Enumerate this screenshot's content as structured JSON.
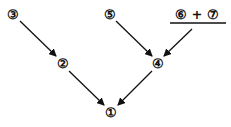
{
  "diagram": {
    "nodes": [
      {
        "id": "n3",
        "label": "③",
        "x": 13,
        "y": 14
      },
      {
        "id": "n2",
        "label": "②",
        "x": 63,
        "y": 63
      },
      {
        "id": "n5",
        "label": "⑤",
        "x": 110,
        "y": 14
      },
      {
        "id": "n67",
        "label": "⑥ + ⑦",
        "x": 197,
        "y": 14
      },
      {
        "id": "n4",
        "label": "④",
        "x": 158,
        "y": 63
      },
      {
        "id": "n1",
        "label": "①",
        "x": 111,
        "y": 112
      }
    ],
    "edges": [
      {
        "from": "③",
        "to": "②"
      },
      {
        "from": "②",
        "to": "①"
      },
      {
        "from": "⑤",
        "to": "④"
      },
      {
        "from": "⑥ + ⑦",
        "to": "④"
      },
      {
        "from": "④",
        "to": "①"
      }
    ],
    "fraction_bar": {
      "x1": 170,
      "x2": 226,
      "y": 23
    }
  }
}
